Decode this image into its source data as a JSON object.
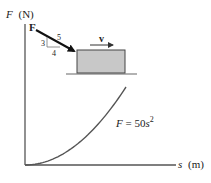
{
  "diagram": {
    "y_axis_label": {
      "var": "F",
      "unit": "(N)"
    },
    "x_axis_label": {
      "var": "s",
      "unit": "(m)"
    },
    "force_label": "F",
    "velocity_label": "v",
    "slope_triangle": {
      "rise": "3",
      "run": "4",
      "hypotenuse": "5"
    },
    "curve_equation": {
      "lhs": "F",
      "eq": " = 50",
      "var": "s",
      "exp": "2"
    },
    "block_color": "#c8c8c8",
    "line_color": "#555555"
  },
  "chart_data": {
    "type": "line",
    "title": "",
    "xlabel": "s (m)",
    "ylabel": "F (N)",
    "equation": "F = 50s^2",
    "series": [
      {
        "name": "F = 50s^2",
        "function": "50*s^2"
      }
    ],
    "grid": false,
    "legend": "none"
  }
}
